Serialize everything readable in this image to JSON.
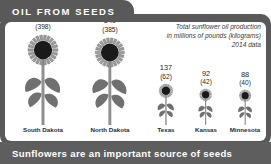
{
  "header": {
    "title": "OIL FROM SEEDS"
  },
  "caption": {
    "line1": "Total sunflower oil production",
    "line2": "in millions of pounds (kilograms)",
    "line3": "2014 data"
  },
  "footer": {
    "text": "Sunflowers are an important source of seeds"
  },
  "colors": {
    "frame": "#595959",
    "banner": "#5e5e5e",
    "title_bg": "#595959",
    "title_text": "#ffffff",
    "petal": "#9a9a9a",
    "petal_edge": "#6f6f6f",
    "center": "#1a1a1a",
    "stem": "#8f8f8f",
    "leaf": "#707070",
    "panel": "#ffffff"
  },
  "chart_data": {
    "type": "bar",
    "title": "OIL FROM SEEDS",
    "subtitle": "Total sunflower oil production in millions of pounds (kilograms), 2014 data",
    "xlabel": "",
    "ylabel": "Millions of pounds (kilograms)",
    "categories": [
      "South Dakota",
      "North Dakota",
      "Texas",
      "Kansas",
      "Minnesota"
    ],
    "values": [
      877,
      849,
      137,
      92,
      88
    ],
    "values_kg": [
      398,
      385,
      62,
      42,
      40
    ],
    "value_labels": [
      "877",
      "849",
      "137",
      "92",
      "88"
    ],
    "value_sublabels": [
      "(398)",
      "(385)",
      "(62)",
      "(42)",
      "(40)"
    ],
    "units": "millions of pounds",
    "units_secondary": "kilograms",
    "grid": false,
    "legend": "none",
    "note": "Pictorial chart: each sunflower icon is scaled in proportion to the state's production value."
  },
  "items": [
    {
      "state": "South Dakota",
      "value": "877",
      "sub": "(398)",
      "scale": 1.0,
      "x": 6,
      "w": 64
    },
    {
      "state": "North Dakota",
      "value": "849",
      "sub": "(385)",
      "scale": 0.97,
      "x": 73,
      "w": 64
    },
    {
      "state": "Texas",
      "value": "137",
      "sub": "(62)",
      "scale": 0.46,
      "x": 142,
      "w": 38
    },
    {
      "state": "Kansas",
      "value": "92",
      "sub": "(42)",
      "scale": 0.4,
      "x": 182,
      "w": 38
    },
    {
      "state": "Minnesota",
      "value": "88",
      "sub": "(40)",
      "scale": 0.39,
      "x": 221,
      "w": 38
    }
  ]
}
